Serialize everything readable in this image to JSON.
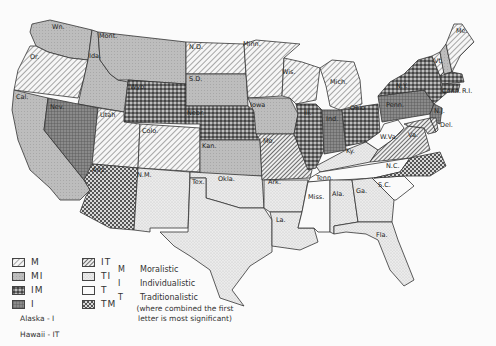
{
  "map": {
    "type": "choropleth",
    "subject": "Political culture of the United States by state",
    "colors": {
      "background": "#fbfbfb",
      "outline": "#333333",
      "fill_light": "#f4f4f4",
      "fill_grey": "#bdbdbd",
      "fill_dark": "#555555"
    },
    "states": [
      {
        "id": "wa",
        "label": "Wn.",
        "category": "MI"
      },
      {
        "id": "or",
        "label": "Or.",
        "category": "M"
      },
      {
        "id": "ca",
        "label": "Cal.",
        "category": "MI"
      },
      {
        "id": "id",
        "label": "Ida.",
        "category": "MI"
      },
      {
        "id": "nv",
        "label": "Nev.",
        "category": "I"
      },
      {
        "id": "mt",
        "label": "Mont.",
        "category": "MI"
      },
      {
        "id": "wy",
        "label": "Wyo.",
        "category": "IM"
      },
      {
        "id": "ut",
        "label": "Utah",
        "category": "M"
      },
      {
        "id": "co",
        "label": "Colo.",
        "category": "M"
      },
      {
        "id": "az",
        "label": "Ariz.",
        "category": "TM"
      },
      {
        "id": "nm",
        "label": "N.M.",
        "category": "TI"
      },
      {
        "id": "nd",
        "label": "N.D.",
        "category": "M"
      },
      {
        "id": "sd",
        "label": "S.D.",
        "category": "MI"
      },
      {
        "id": "ne",
        "label": "Nebr.",
        "category": "IM"
      },
      {
        "id": "ks",
        "label": "Kan.",
        "category": "MI"
      },
      {
        "id": "ok",
        "label": "Okla.",
        "category": "TI"
      },
      {
        "id": "tx",
        "label": "Tex.",
        "category": "TI"
      },
      {
        "id": "mn",
        "label": "Minn.",
        "category": "M"
      },
      {
        "id": "ia",
        "label": "Iowa",
        "category": "MI"
      },
      {
        "id": "mo",
        "label": "Mo.",
        "category": "IT"
      },
      {
        "id": "ar",
        "label": "Ark.",
        "category": "TI"
      },
      {
        "id": "la",
        "label": "La.",
        "category": "TI"
      },
      {
        "id": "wi",
        "label": "Wis.",
        "category": "M"
      },
      {
        "id": "il",
        "label": "Ill.",
        "category": "IM"
      },
      {
        "id": "mi",
        "label": "Mich.",
        "category": "M"
      },
      {
        "id": "in",
        "label": "Ind.",
        "category": "I"
      },
      {
        "id": "oh",
        "label": "Ohio",
        "category": "IM"
      },
      {
        "id": "ky",
        "label": "Ky.",
        "category": "TI"
      },
      {
        "id": "tn",
        "label": "Tenn.",
        "category": "T"
      },
      {
        "id": "ms",
        "label": "Miss.",
        "category": "T"
      },
      {
        "id": "al",
        "label": "Ala.",
        "category": "TI"
      },
      {
        "id": "ga",
        "label": "Ga.",
        "category": "TI"
      },
      {
        "id": "fl",
        "label": "Fla.",
        "category": "TI"
      },
      {
        "id": "sc",
        "label": "S.C.",
        "category": "T"
      },
      {
        "id": "nc",
        "label": "N.C.",
        "category": "TM"
      },
      {
        "id": "va",
        "label": "Va.",
        "category": "IT"
      },
      {
        "id": "wv",
        "label": "W.Va.",
        "category": "T"
      },
      {
        "id": "pa",
        "label": "Penn.",
        "category": "I"
      },
      {
        "id": "ny",
        "label": "N.Y.",
        "category": "IM"
      },
      {
        "id": "nj",
        "label": "N.J.",
        "category": "I"
      },
      {
        "id": "de",
        "label": "Del.",
        "category": "IT"
      },
      {
        "id": "md",
        "label": "Md.",
        "category": "IT"
      },
      {
        "id": "vt",
        "label": "Vt.",
        "category": "M"
      },
      {
        "id": "nh",
        "label": "N.H.",
        "category": "MI"
      },
      {
        "id": "me",
        "label": "Me.",
        "category": "M"
      },
      {
        "id": "ma",
        "label": "Mass.",
        "category": "IM"
      },
      {
        "id": "ct",
        "label": "Conn.",
        "category": "IM"
      },
      {
        "id": "ri",
        "label": "R.I.",
        "category": "IM"
      }
    ]
  },
  "legend": {
    "items": [
      {
        "code": "M",
        "pattern": "M"
      },
      {
        "code": "IT",
        "pattern": "IT"
      },
      {
        "code": "MI",
        "pattern": "MI"
      },
      {
        "code": "TI",
        "pattern": "TI"
      },
      {
        "code": "IM",
        "pattern": "IM"
      },
      {
        "code": "T",
        "pattern": "T"
      },
      {
        "code": "I",
        "pattern": "I"
      },
      {
        "code": "TM",
        "pattern": "TM"
      }
    ],
    "key": [
      {
        "letter": "M",
        "meaning": "Moralistic"
      },
      {
        "letter": "I",
        "meaning": "Individualistic"
      },
      {
        "letter": "T",
        "meaning": "Traditionalistic"
      }
    ],
    "note_line1": "(where combined the first",
    "note_line2": "letter is most significant)",
    "alaska": "Alaska  -  I",
    "hawaii": "Hawaii  -  IT"
  }
}
